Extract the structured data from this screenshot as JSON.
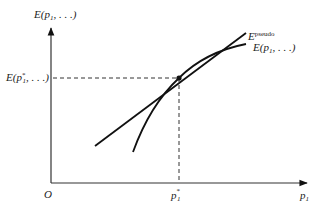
{
  "diagram": {
    "y_axis_label": {
      "main": "E(p",
      "sub": "1",
      "tail": ", . . .)"
    },
    "x_axis_label": {
      "main": "p",
      "sub": "1"
    },
    "origin_label": "O",
    "tangent_label": {
      "main": "E",
      "sup": "pseudo"
    },
    "curve_label": {
      "main": "E(p",
      "sub": "1",
      "tail": ", . . .)"
    },
    "y_marker_label": {
      "main": "E(p",
      "sup": "*",
      "sub": "1",
      "tail": ", . . .)"
    },
    "x_marker_label": {
      "main": "p",
      "sup": "*",
      "sub": "1"
    },
    "colors": {
      "stroke": "#111111",
      "dashed": "#333333",
      "text": "#222222"
    }
  }
}
